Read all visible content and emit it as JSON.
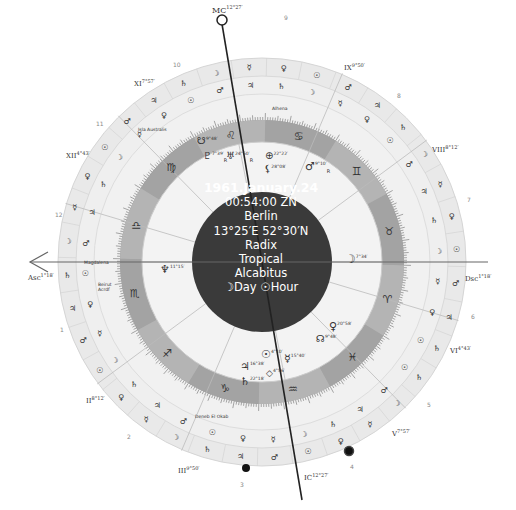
{
  "center": {
    "date": "1961.January.24",
    "time": "00:54:00 ZN",
    "place": "Berlin",
    "coords": "13°25′E 52°30′N",
    "chart_type": "Radix",
    "zodiac": "Tropical",
    "house_system": "Alcabitus",
    "day_hour": "☽Day ☉Hour"
  },
  "angles": {
    "asc": {
      "label": "Asc",
      "deg": "1°18′"
    },
    "dsc": {
      "label": "Dsc",
      "deg": "1°18′"
    },
    "mc": {
      "label": "MC",
      "deg": "12°27′"
    },
    "ic": {
      "label": "IC",
      "deg": "12°27′"
    }
  },
  "house_cusps": [
    {
      "label": "XI",
      "deg": "7°57′"
    },
    {
      "label": "XII",
      "deg": "4°43′"
    },
    {
      "label": "II",
      "deg": "8°12′"
    },
    {
      "label": "III",
      "deg": "9°50′"
    },
    {
      "label": "V",
      "deg": "7°57′"
    },
    {
      "label": "VI",
      "deg": "4°43′"
    },
    {
      "label": "VIII",
      "deg": "8°12′"
    },
    {
      "label": "IX",
      "deg": "9°50′"
    }
  ],
  "house_numbers": [
    "1",
    "2",
    "3",
    "4",
    "5",
    "6",
    "7",
    "8",
    "9",
    "10",
    "11",
    "12"
  ],
  "signs": [
    {
      "name": "aries",
      "glyph": "♈"
    },
    {
      "name": "taurus",
      "glyph": "♉"
    },
    {
      "name": "gemini",
      "glyph": "♊"
    },
    {
      "name": "cancer",
      "glyph": "♋"
    },
    {
      "name": "leo",
      "glyph": "♌"
    },
    {
      "name": "virgo",
      "glyph": "♍"
    },
    {
      "name": "libra",
      "glyph": "♎"
    },
    {
      "name": "scorpio",
      "glyph": "♏"
    },
    {
      "name": "sagittarius",
      "glyph": "♐"
    },
    {
      "name": "capricorn",
      "glyph": "♑"
    },
    {
      "name": "aquarius",
      "glyph": "♒"
    },
    {
      "name": "pisces",
      "glyph": "♓"
    }
  ],
  "planets": [
    {
      "name": "moon",
      "glyph": "☽",
      "deg": "7°34′"
    },
    {
      "name": "venus",
      "glyph": "♀",
      "deg": "20°58′"
    },
    {
      "name": "north-node",
      "glyph": "☊",
      "deg": "9°48′"
    },
    {
      "name": "mercury",
      "glyph": "☿",
      "deg": "15°40′"
    },
    {
      "name": "sun",
      "glyph": "☉",
      "deg": "4°10′"
    },
    {
      "name": "part-of-fortune",
      "glyph": "⊗",
      "deg": "4°56′"
    },
    {
      "name": "jupiter",
      "glyph": "♃",
      "deg": "16°38′"
    },
    {
      "name": "saturn",
      "glyph": "♄",
      "deg": "22°18′"
    },
    {
      "name": "neptune",
      "glyph": "♆",
      "deg": "11°15′"
    },
    {
      "name": "pluto",
      "glyph": "♇",
      "deg": "7°39′",
      "retro": "R"
    },
    {
      "name": "uranus",
      "glyph": "♅",
      "deg": "24°50′",
      "retro": "R"
    },
    {
      "name": "south-node",
      "glyph": "☋",
      "deg": "9°48′"
    },
    {
      "name": "lilith",
      "glyph": "⚸",
      "deg": "28°08′"
    },
    {
      "name": "vertex",
      "glyph": "⊕",
      "deg": "22°22′"
    },
    {
      "name": "mars",
      "glyph": "♂",
      "deg": "9°10′",
      "retro": "R"
    }
  ],
  "fixed_stars": [
    {
      "name": "Isla Australis"
    },
    {
      "name": "Alhena"
    },
    {
      "name": "Magdalena"
    },
    {
      "name": "Beirut Acrdf"
    },
    {
      "name": "Deneb El Okab"
    }
  ]
}
